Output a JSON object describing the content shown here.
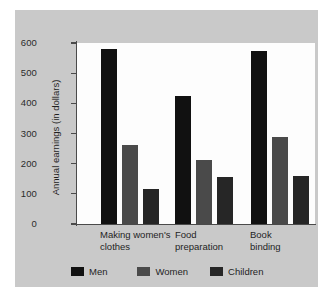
{
  "chart_data": {
    "type": "bar",
    "title": "",
    "subtitle": "",
    "xlabel": "",
    "ylabel": "Annual earnings (in dollars)",
    "ylim": [
      0,
      600
    ],
    "ytick_labels": [
      "600",
      "500",
      "400",
      "300",
      "200",
      "100",
      "0"
    ],
    "ytick_values": [
      600,
      500,
      400,
      300,
      200,
      100,
      0
    ],
    "grid": false,
    "legend_position": "bottom",
    "categories": [
      "Making women's\nclothes",
      "Food\npreparation",
      "Book\nbinding"
    ],
    "category_labels_flat": [
      "Making women's clothes",
      "Food preparation",
      "Book binding"
    ],
    "series": [
      {
        "name": "Men",
        "color": "#111111",
        "values": [
          580,
          423,
          575
        ]
      },
      {
        "name": "Women",
        "color": "#4a4a4a",
        "values": [
          262,
          212,
          290
        ]
      },
      {
        "name": "Children",
        "color": "#262626",
        "values": [
          115,
          155,
          158
        ]
      }
    ]
  },
  "legend": {
    "items": [
      {
        "label": "Men",
        "color": "#111111"
      },
      {
        "label": "Women",
        "color": "#4a4a4a"
      },
      {
        "label": "Children",
        "color": "#262626"
      }
    ]
  },
  "colors": {
    "panel_background": "#c9c9c9",
    "plot_background": "#fdfdfd",
    "axis": "#4a4a4a",
    "text": "#1f1f1f"
  }
}
